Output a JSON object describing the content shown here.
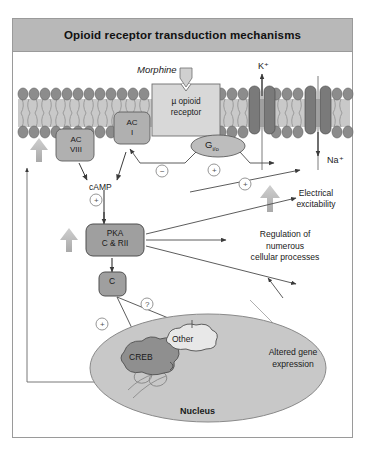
{
  "figure": {
    "title": "Opioid receptor transduction mechanisms",
    "domain": "biomedical signal transduction diagram"
  },
  "membrane": {
    "ligand_label": "Morphine",
    "receptor_label": "µ opioid\nreceptor",
    "receptor_line1": "µ opioid",
    "receptor_line2": "receptor",
    "g_protein_label": "G",
    "g_protein_subscript": "i/o",
    "potassium_label": "K⁺",
    "sodium_label": "Na⁺",
    "adenylyl_cyclase_8_line1": "AC",
    "adenylyl_cyclase_8_line2": "VIII",
    "adenylyl_cyclase_1_line1": "AC",
    "adenylyl_cyclase_1_line2": "I"
  },
  "cytoplasm": {
    "camp_label": "cAMP",
    "pka_line1": "PKA",
    "pka_line2": "C & RII",
    "catalytic_subunit_label": "C",
    "electrical_excitability_line1": "Electrical",
    "electrical_excitability_line2": "excitability",
    "regulation_line1": "Regulation of",
    "regulation_line2": "numerous",
    "regulation_line3": "cellular processes"
  },
  "nucleus": {
    "label": "Nucleus",
    "creb_label": "CREB",
    "other_label": "Other",
    "altered_gene_line1": "Altered gene",
    "altered_gene_line2": "expression"
  },
  "symbols": {
    "inhibit": "−",
    "activate": "+",
    "unknown": "?",
    "inhibit_ac1": "−",
    "activate_k": "+",
    "activate_na": "+",
    "activate_camp": "+",
    "activate_creb": "+",
    "unknown_c": "?"
  },
  "colors": {
    "title_bar": "#b8b8b8",
    "frame_border": "#9a9a9a",
    "membrane_head": "#8c8c8c",
    "membrane_tail_bg": "#c9c9c9",
    "channel": "#7a7a7a",
    "receptor_box": "#d8d8d8",
    "g_protein": "#bdbdbd",
    "pka_box": "#9f9f9f",
    "nucleus_fill": "#c8c8c8",
    "creb_fill": "#8f8f8f",
    "big_arrow": "#b5b5b5",
    "line": "#4a4a4a"
  }
}
